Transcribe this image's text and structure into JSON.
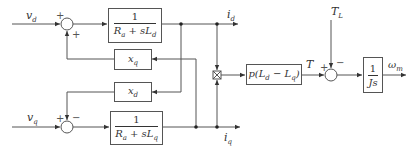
{
  "diagram": {
    "type": "block-diagram",
    "inputs": {
      "vd": "v",
      "vd_sub": "d",
      "vq": "v",
      "vq_sub": "q",
      "TL": "T",
      "TL_sub": "L"
    },
    "outputs": {
      "id": "i",
      "id_sub": "d",
      "iq": "i",
      "iq_sub": "q",
      "wm": "ω",
      "wm_sub": "m",
      "T": "T"
    },
    "blocks": {
      "d_axis": {
        "num": "1",
        "den": "R",
        "den_sub1": "a",
        "den_mid": " + sL",
        "den_sub2": "d"
      },
      "q_axis": {
        "num": "1",
        "den": "R",
        "den_sub1": "a",
        "den_mid": " + sL",
        "den_sub2": "q"
      },
      "xq": {
        "label": "x",
        "sub": "q"
      },
      "xd": {
        "label": "x",
        "sub": "d"
      },
      "torque_gain": {
        "pre": "p(L",
        "sub1": "d",
        "mid": " − L",
        "sub2": "q",
        "post": ")"
      },
      "mech": {
        "num": "1",
        "den": "Js"
      }
    },
    "junctions": {
      "sum_d": {
        "signs": [
          "+",
          "+"
        ]
      },
      "sum_q": {
        "signs": [
          "+",
          "−"
        ]
      },
      "sum_torque": {
        "signs": [
          "+",
          "−"
        ]
      },
      "multiplier": "⊠"
    }
  }
}
